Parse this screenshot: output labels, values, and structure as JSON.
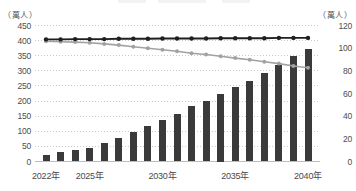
{
  "axes": {
    "left_unit": "（萬人）",
    "right_unit": "（萬人）",
    "left_ticks": [
      450,
      400,
      350,
      300,
      250,
      200,
      150,
      100,
      50,
      0
    ],
    "right_ticks": [
      120,
      100,
      80,
      60,
      40,
      20,
      0
    ],
    "x_tick_labels": [
      {
        "label": "2022年",
        "index": 0
      },
      {
        "label": "2025年",
        "index": 3
      },
      {
        "label": "2030年",
        "index": 8
      },
      {
        "label": "2035年",
        "index": 13
      },
      {
        "label": "2040年",
        "index": 18
      }
    ]
  },
  "chart_data": {
    "type": "bar",
    "subtype": "combo-bar-and-lines-dual-axis",
    "categories": [
      2022,
      2023,
      2024,
      2025,
      2026,
      2027,
      2028,
      2029,
      2030,
      2031,
      2032,
      2033,
      2034,
      2035,
      2036,
      2037,
      2038,
      2039,
      2040
    ],
    "bars": {
      "name": "bar-series-right-axis",
      "axis": "right",
      "values": [
        6,
        8,
        10,
        12,
        16,
        21,
        26,
        31,
        37,
        42,
        49,
        53,
        60,
        66,
        71,
        78,
        85,
        93,
        99
      ]
    },
    "series": [
      {
        "name": "black-line-left-axis",
        "axis": "left",
        "color": "#1f1f1f",
        "values": [
          404,
          404,
          405,
          405,
          405,
          406,
          406,
          406,
          407,
          407,
          407,
          407,
          408,
          408,
          408,
          408,
          409,
          409,
          409
        ]
      },
      {
        "name": "gray-line-left-axis",
        "axis": "left",
        "color": "#a2a2a2",
        "values": [
          398,
          396,
          395,
          393,
          389,
          385,
          380,
          375,
          370,
          365,
          358,
          354,
          348,
          342,
          337,
          330,
          324,
          316,
          310
        ]
      }
    ],
    "title": "",
    "xlabel": "",
    "ylabel_left": "萬人",
    "ylabel_right": "萬人",
    "left_axis_range": [
      0,
      450
    ],
    "right_axis_range": [
      0,
      120
    ],
    "grid": "horizontal-dotted",
    "legend": "cropped-out-of-frame-at-top"
  },
  "colors": {
    "bar": "#3a3a3a",
    "black_line": "#1f1f1f",
    "gray_line": "#a2a2a2",
    "grid": "#c9c9c9",
    "baseline": "#bdbdbd",
    "tick_text": "#4d4d4d"
  }
}
